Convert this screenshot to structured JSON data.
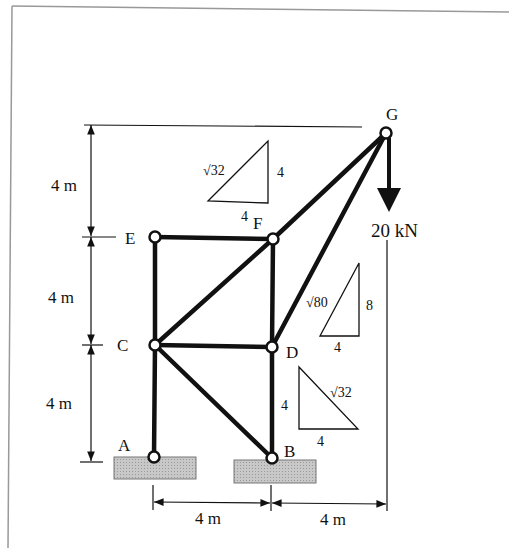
{
  "diagram": {
    "nodes": [
      {
        "id": "A",
        "label": "A",
        "x": 154,
        "y": 457
      },
      {
        "id": "B",
        "label": "B",
        "x": 272,
        "y": 458
      },
      {
        "id": "C",
        "label": "C",
        "x": 155,
        "y": 345
      },
      {
        "id": "D",
        "label": "D",
        "x": 272,
        "y": 347
      },
      {
        "id": "E",
        "label": "E",
        "x": 155,
        "y": 237
      },
      {
        "id": "F",
        "label": "F",
        "x": 273,
        "y": 239
      },
      {
        "id": "G",
        "label": "G",
        "x": 386,
        "y": 133
      }
    ],
    "members": [
      [
        "A",
        "C"
      ],
      [
        "C",
        "E"
      ],
      [
        "E",
        "F"
      ],
      [
        "C",
        "F"
      ],
      [
        "C",
        "D"
      ],
      [
        "F",
        "D"
      ],
      [
        "D",
        "B"
      ],
      [
        "C",
        "B"
      ],
      [
        "F",
        "G"
      ],
      [
        "D",
        "G"
      ]
    ],
    "supports": [
      {
        "node": "A",
        "type": "pin"
      },
      {
        "node": "B",
        "type": "pin"
      }
    ],
    "load": {
      "node": "G",
      "value": "20 kN",
      "direction": "down"
    },
    "dimensions": {
      "vertical": [
        "4 m",
        "4 m",
        "4 m"
      ],
      "horizontal": [
        "4 m",
        "4 m"
      ]
    },
    "slope_triangles": [
      {
        "hyp": "√32",
        "vert": "4",
        "horiz": "4"
      },
      {
        "hyp": "√80",
        "vert": "8",
        "horiz": "4"
      },
      {
        "hyp": "√32",
        "vert": "4",
        "horiz": "4"
      }
    ]
  }
}
